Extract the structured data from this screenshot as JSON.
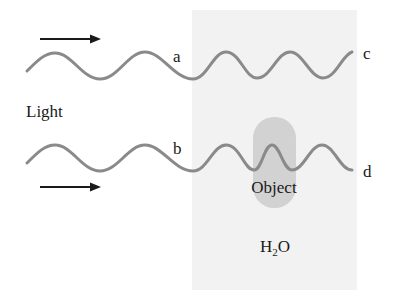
{
  "diagram": {
    "labels": {
      "light": "Light",
      "a": "a",
      "b": "b",
      "c": "c",
      "d": "d",
      "object": "Object",
      "water_main": "H",
      "water_sub": "2",
      "water_end": "O"
    },
    "colors": {
      "background": "#ffffff",
      "water_panel": "#f2f2f2",
      "object": "#d2d2d2",
      "wave": "#8a8a8a",
      "arrow": "#1a1a1a",
      "text": "#1a1a1a"
    }
  }
}
